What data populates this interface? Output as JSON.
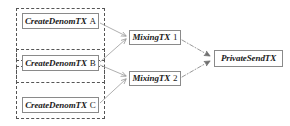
{
  "diagram": {
    "type": "flow-diagram",
    "background_color": "#ffffff",
    "node_border_color": "#8a8a8a",
    "group_border_color": "#555555",
    "edge_color": "#9a9a9a",
    "text_color": "#1a1a1a",
    "groups": [
      {
        "id": "group-a",
        "label": "",
        "x": 16,
        "y": 8,
        "width": 89,
        "height": 53,
        "style": "dashed"
      },
      {
        "id": "group-b",
        "label": "",
        "x": 16,
        "y": 49,
        "width": 89,
        "height": 34,
        "style": "dashed"
      },
      {
        "id": "group-c",
        "label": "",
        "x": 16,
        "y": 66,
        "width": 89,
        "height": 53,
        "style": "dashed"
      }
    ],
    "nodes": [
      {
        "id": "create-denom-tx-a",
        "name": "CreateDenomTX",
        "suffix": "A",
        "x": 22,
        "y": 13,
        "width": 77,
        "height": 16
      },
      {
        "id": "create-denom-tx-b",
        "name": "CreateDenomTX",
        "suffix": "B",
        "x": 22,
        "y": 55,
        "width": 77,
        "height": 16
      },
      {
        "id": "create-denom-tx-c",
        "name": "CreateDenomTX",
        "suffix": "C",
        "x": 22,
        "y": 97,
        "width": 77,
        "height": 16
      },
      {
        "id": "mixing-tx-1",
        "name": "MixingTX",
        "suffix": "1",
        "x": 129,
        "y": 30,
        "width": 52,
        "height": 15
      },
      {
        "id": "mixing-tx-2",
        "name": "MixingTX",
        "suffix": "2",
        "x": 129,
        "y": 71,
        "width": 52,
        "height": 15
      },
      {
        "id": "private-send-tx",
        "name": "PrivateSendTX",
        "suffix": "",
        "x": 214,
        "y": 50,
        "width": 69,
        "height": 17
      }
    ],
    "edges": [
      {
        "id": "edge-a-to-mixing1",
        "from": "create-denom-tx-a",
        "to": "mixing-tx-1",
        "style": "solid",
        "arrowhead": true
      },
      {
        "id": "edge-b-to-mixing1",
        "from": "create-denom-tx-b",
        "to": "mixing-tx-1",
        "style": "solid",
        "arrowhead": true
      },
      {
        "id": "edge-b-to-mixing2",
        "from": "create-denom-tx-b",
        "to": "mixing-tx-2",
        "style": "solid",
        "arrowhead": true
      },
      {
        "id": "edge-c-to-mixing2",
        "from": "create-denom-tx-c",
        "to": "mixing-tx-2",
        "style": "solid",
        "arrowhead": true
      },
      {
        "id": "edge-mixing1-to-private",
        "from": "mixing-tx-1",
        "to": "private-send-tx",
        "style": "dash-dot",
        "arrowhead": true
      },
      {
        "id": "edge-mixing2-to-private",
        "from": "mixing-tx-2",
        "to": "private-send-tx",
        "style": "dash-dot",
        "arrowhead": true
      }
    ]
  }
}
